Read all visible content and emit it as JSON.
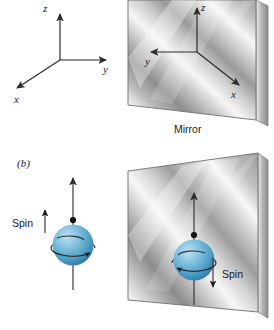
{
  "figure": {
    "background_color": "#ffffff"
  },
  "panel_a": {
    "label": "",
    "object_axes": {
      "name": "right-handed coordinate axes",
      "z_label": "z",
      "y_label": "y",
      "x_label": "x"
    },
    "mirror": {
      "caption": "Mirror",
      "image_axes": {
        "z_label": "z",
        "y_label": "y",
        "x_label": "x"
      }
    }
  },
  "panel_b": {
    "label": "(b)",
    "object": {
      "spin_label": "Spin",
      "spin_direction": "up",
      "sphere_color": "#64afd4",
      "arrow_direction": "up"
    },
    "mirror": {
      "spin_label": "Spin",
      "spin_direction": "down",
      "sphere_color": "#64afd4",
      "arrow_direction": "up"
    }
  },
  "colors": {
    "sphere_light": "#a8d4e8",
    "sphere_mid": "#67b2d6",
    "sphere_dark": "#2f7ba3",
    "mirror_light": "#f2f2f2",
    "mirror_dark": "#8f8f8f",
    "ink": "#1a1a1a"
  }
}
